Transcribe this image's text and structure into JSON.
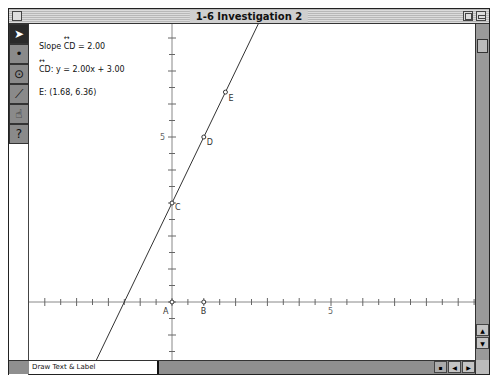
{
  "window": {
    "title": "1-6 Investigation 2"
  },
  "toolbox": {
    "tools": [
      {
        "name": "selection-arrow-tool",
        "icon": "arrow-icon",
        "glyph": "➤",
        "active": true
      },
      {
        "name": "point-tool",
        "icon": "point-icon",
        "glyph": "•",
        "active": false
      },
      {
        "name": "compass-tool",
        "icon": "circle-icon",
        "glyph": "⊙",
        "active": false
      },
      {
        "name": "straightedge-tool",
        "icon": "segment-icon",
        "glyph": "⟋",
        "active": false
      },
      {
        "name": "text-tool",
        "icon": "hand-icon",
        "glyph": "☝",
        "active": false
      },
      {
        "name": "custom-tool",
        "icon": "question-icon",
        "glyph": "?",
        "active": false
      }
    ]
  },
  "measurements": {
    "slope_prefix": "Slope ",
    "slope_segment": "CD",
    "slope_value": " = 2.00",
    "equation_segment": "CD",
    "equation_value": ": y = 2.00x + 3.00",
    "point_e": "E: (1.68, 6.36)"
  },
  "graph": {
    "origin_px": [
      143,
      278
    ],
    "unit_x_px": 31.8,
    "unit_y_px": 33,
    "x_axis_label_5": "5",
    "y_axis_label_5": "5",
    "points": [
      {
        "label": "A",
        "x": 0,
        "y": 0
      },
      {
        "label": "B",
        "x": 1,
        "y": 0
      },
      {
        "label": "C",
        "x": 0,
        "y": 3
      },
      {
        "label": "D",
        "x": 1,
        "y": 5
      },
      {
        "label": "E",
        "x": 1.68,
        "y": 6.36
      }
    ],
    "line": {
      "slope": 2.0,
      "intercept": 3.0
    }
  },
  "status_bar": {
    "text": "Draw Text & Label"
  }
}
